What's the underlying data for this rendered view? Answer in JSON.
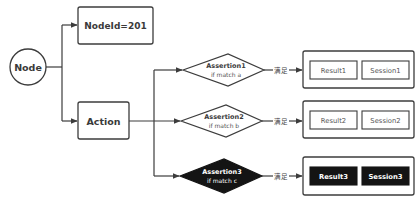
{
  "diagram": {
    "colors": {
      "stroke": "#3c3c3c",
      "dark_fill": "#141414",
      "background": "#ffffff",
      "text": "#3a3a3a"
    },
    "root": {
      "label": "Node",
      "shape": "circle"
    },
    "nodeid_box": {
      "label": "NodeId=201"
    },
    "action_box": {
      "label": "Action"
    },
    "assertions": [
      {
        "title": "Assertion1",
        "condition": "if match a",
        "edge_label": "满足",
        "result": "Result1",
        "session": "Session1",
        "style": "outline"
      },
      {
        "title": "Assertion2",
        "condition": "if match b",
        "edge_label": "满足",
        "result": "Result2",
        "session": "Session2",
        "style": "outline"
      },
      {
        "title": "Assertion3",
        "condition": "if match c",
        "edge_label": "满足",
        "result": "Result3",
        "session": "Session3",
        "style": "filled"
      }
    ]
  }
}
